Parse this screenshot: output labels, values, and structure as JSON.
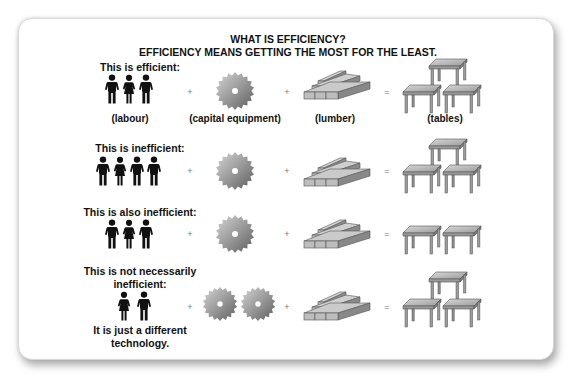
{
  "header": {
    "title": "WHAT IS EFFICIENCY?",
    "subtitle": "EFFICIENCY MEANS GETTING THE MOST FOR THE LEAST."
  },
  "captions": {
    "labour": "(labour)",
    "capital": "(capital equipment)",
    "lumber": "(lumber)",
    "tables": "(tables)"
  },
  "operators": {
    "plus": "+",
    "equals": "="
  },
  "rows": [
    {
      "label": "This is efficient:",
      "people": 3,
      "saws": 1,
      "lumber_piles": 1,
      "tables": 3
    },
    {
      "label": "This is inefficient:",
      "people": 4,
      "saws": 1,
      "lumber_piles": 1,
      "tables": 3
    },
    {
      "label": "This is also inefficient:",
      "people": 3,
      "saws": 1,
      "lumber_piles": 1,
      "tables": 2
    },
    {
      "label_line1": "This is not necessarily",
      "label_line2": "inefficient:",
      "people": 2,
      "saws": 2,
      "lumber_piles": 1,
      "tables": 3,
      "note_line1": "It is just a different",
      "note_line2": "technology."
    }
  ],
  "icons": {
    "person": "person-silhouette-icon",
    "saw": "circular-saw-blade-icon",
    "lumber": "lumber-stack-icon",
    "table": "table-icon"
  },
  "colors": {
    "text": "#111111",
    "icon_fill": "#111111",
    "metal": "#8a8a8a",
    "card_border": "#d8d8d8"
  }
}
